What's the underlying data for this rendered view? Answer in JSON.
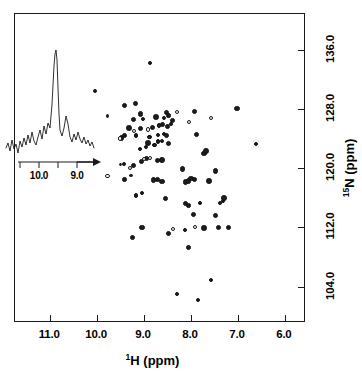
{
  "figure": {
    "kind": "2d-nmr-hsqc-spectrum",
    "background": "#ffffff",
    "foreground": "#1a1a1a"
  },
  "axes": {
    "x": {
      "title_prefix": "1",
      "title_main": "H (ppm)",
      "title_full": "1H (ppm)",
      "unit": "ppm",
      "nucleus": "1H",
      "min": 5.55,
      "max": 11.75,
      "direction": "reversed",
      "ticks": [
        "11.0",
        "10.0",
        "9.0",
        "8.0",
        "7.0",
        "6.0"
      ],
      "tick_values": [
        11.0,
        10.0,
        9.0,
        8.0,
        7.0,
        6.0
      ]
    },
    "y": {
      "title_prefix": "15",
      "title_main": "N (ppm)",
      "title_full": "15N (ppm)",
      "unit": "ppm",
      "nucleus": "15N",
      "min": 99.1,
      "max": 140.8,
      "direction": "reversed",
      "ticks": [
        "104.0",
        "112.0",
        "120.0",
        "128.0",
        "136.0"
      ],
      "tick_values": [
        104.0,
        112.0,
        120.0,
        128.0,
        136.0
      ],
      "label_side": "right"
    }
  },
  "inset": {
    "kind": "1d-trace",
    "axis_ticks": [
      "10.0",
      "9.0"
    ],
    "axis_tick_values": [
      10.0,
      9.0
    ],
    "arrow_glyph": "arrow-right",
    "main_peak_ppm": 9.7,
    "trace_points": "2,104 4,99 6,107 8,96 10,105 12,100 14,109 16,97 18,103 20,94 22,101 24,91 26,99 28,88 30,97 32,101 34,93 36,86 38,95 40,82 42,90 44,79 46,84 48,60 50,22 51,10 52,6 53,16 54,44 55,70 56,86 58,92 60,84 62,72 64,80 66,93 68,98 70,90 72,96 74,88 76,95 78,99 80,93 82,100 84,96 86,102 88,98 90,104",
    "baseline_y": 104
  },
  "chart_data": {
    "type": "scatter",
    "title": "",
    "subtitle": "",
    "xlabel": "1H (ppm)",
    "ylabel": "15N (ppm)",
    "xlim": [
      11.75,
      5.55
    ],
    "ylim": [
      140.8,
      99.1
    ],
    "grid": false,
    "legend": null,
    "annotations": [
      {
        "type": "inset",
        "label": "1D trace with arrow to crosspeak",
        "arrow_target_ppm": [
          9.78,
          118.9
        ]
      }
    ],
    "series": [
      {
        "name": "crosspeaks-filled",
        "marker": "filled-circle",
        "color": "#1d1d1d",
        "points": [
          [
            8.3,
            103.0
          ],
          [
            7.85,
            102.2
          ],
          [
            7.58,
            104.9
          ],
          [
            8.05,
            109.3
          ],
          [
            9.25,
            110.6
          ],
          [
            8.48,
            111.2
          ],
          [
            8.12,
            111.7
          ],
          [
            9.05,
            112.0
          ],
          [
            7.72,
            111.9
          ],
          [
            7.42,
            112.0
          ],
          [
            7.2,
            112.0
          ],
          [
            7.95,
            113.8
          ],
          [
            7.48,
            113.6
          ],
          [
            8.05,
            115.0
          ],
          [
            8.12,
            115.2
          ],
          [
            7.8,
            115.3
          ],
          [
            7.38,
            115.3
          ],
          [
            7.32,
            115.6
          ],
          [
            7.3,
            116.0
          ],
          [
            8.55,
            115.9
          ],
          [
            9.18,
            116.3
          ],
          [
            9.05,
            116.6
          ],
          [
            9.42,
            118.5
          ],
          [
            9.28,
            119.0
          ],
          [
            8.8,
            118.4
          ],
          [
            8.72,
            118.5
          ],
          [
            8.62,
            118.2
          ],
          [
            8.12,
            118.1
          ],
          [
            8.05,
            118.3
          ],
          [
            8.0,
            118.6
          ],
          [
            7.92,
            118.5
          ],
          [
            7.62,
            118.3
          ],
          [
            7.48,
            119.6
          ],
          [
            8.18,
            119.9
          ],
          [
            9.5,
            120.5
          ],
          [
            9.42,
            120.6
          ],
          [
            9.22,
            120.4
          ],
          [
            9.05,
            120.9
          ],
          [
            8.95,
            121.3
          ],
          [
            8.72,
            121.0
          ],
          [
            8.62,
            121.1
          ],
          [
            7.72,
            122.0
          ],
          [
            7.68,
            122.3
          ],
          [
            6.62,
            123.2
          ],
          [
            9.08,
            122.6
          ],
          [
            8.95,
            122.9
          ],
          [
            8.78,
            123.1
          ],
          [
            8.92,
            123.4
          ],
          [
            8.7,
            123.6
          ],
          [
            8.62,
            123.7
          ],
          [
            8.48,
            123.3
          ],
          [
            9.48,
            124.1
          ],
          [
            9.42,
            124.4
          ],
          [
            9.18,
            124.4
          ],
          [
            8.88,
            124.2
          ],
          [
            8.7,
            124.5
          ],
          [
            8.58,
            124.6
          ],
          [
            8.52,
            124.4
          ],
          [
            7.88,
            124.6
          ],
          [
            9.32,
            125.4
          ],
          [
            9.08,
            125.3
          ],
          [
            8.82,
            125.5
          ],
          [
            8.68,
            125.7
          ],
          [
            8.6,
            125.9
          ],
          [
            8.5,
            125.6
          ],
          [
            8.42,
            126.0
          ],
          [
            8.4,
            126.4
          ],
          [
            9.22,
            126.5
          ],
          [
            9.02,
            126.6
          ],
          [
            8.75,
            126.9
          ],
          [
            8.58,
            126.8
          ],
          [
            8.48,
            127.1
          ],
          [
            9.08,
            127.3
          ],
          [
            8.52,
            127.5
          ],
          [
            7.92,
            127.6
          ],
          [
            7.02,
            128.1
          ],
          [
            9.78,
            127.0
          ],
          [
            9.42,
            128.5
          ],
          [
            9.18,
            128.7
          ],
          [
            10.05,
            130.4
          ],
          [
            8.88,
            134.2
          ]
        ]
      },
      {
        "name": "crosspeaks-open",
        "marker": "open-circle",
        "color": "#161616",
        "points": [
          [
            9.78,
            118.9
          ],
          [
            7.92,
            112.0
          ],
          [
            8.38,
            111.8
          ],
          [
            9.3,
            120.0
          ],
          [
            9.0,
            121.2
          ],
          [
            8.88,
            121.4
          ],
          [
            9.52,
            124.0
          ],
          [
            9.22,
            125.0
          ],
          [
            8.92,
            125.2
          ],
          [
            8.3,
            127.6
          ],
          [
            7.58,
            126.8
          ],
          [
            8.05,
            126.2
          ]
        ]
      }
    ]
  }
}
